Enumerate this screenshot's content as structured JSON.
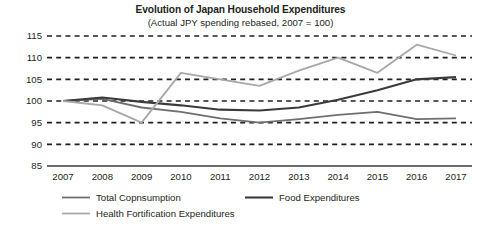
{
  "chart_data": {
    "type": "line",
    "title": "Evolution of Japan Household Expenditures",
    "subtitle": "(Actual JPY spending rebased, 2007 = 100)",
    "xlabel": "",
    "ylabel": "",
    "categories": [
      "2007",
      "2008",
      "2009",
      "2010",
      "2011",
      "2012",
      "2013",
      "2014",
      "2015",
      "2016",
      "2017"
    ],
    "x": [
      2007,
      2008,
      2009,
      2010,
      2011,
      2012,
      2013,
      2014,
      2015,
      2016,
      2017
    ],
    "ylim": [
      85,
      115
    ],
    "yticks": [
      85,
      90,
      95,
      100,
      105,
      110,
      115
    ],
    "grid": "horizontal-dashed",
    "legend_position": "bottom",
    "series": [
      {
        "name": "Total Copnsumption",
        "color": "#6f6f6f",
        "width": 1.8,
        "values": [
          100,
          100.5,
          98.5,
          97.5,
          96,
          95,
          95.8,
          96.8,
          97.5,
          95.8,
          96
        ]
      },
      {
        "name": "Food Expenditures",
        "color": "#3b3b3b",
        "width": 2.1,
        "values": [
          100,
          100.8,
          99.8,
          99,
          98,
          97.8,
          98.5,
          100.3,
          102.5,
          105,
          105.5
        ]
      },
      {
        "name": "Health Fortification Expenditures",
        "color": "#a8a8a8",
        "width": 1.8,
        "values": [
          100,
          99,
          95,
          106.5,
          105,
          103.5,
          107,
          110,
          106.5,
          113,
          110.5
        ]
      }
    ]
  },
  "legend": {
    "items": [
      {
        "label": "Total Copnsumption",
        "color": "#6f6f6f"
      },
      {
        "label": "Food Expenditures",
        "color": "#3b3b3b"
      },
      {
        "label": "Health Fortification Expenditures",
        "color": "#a8a8a8"
      }
    ]
  }
}
